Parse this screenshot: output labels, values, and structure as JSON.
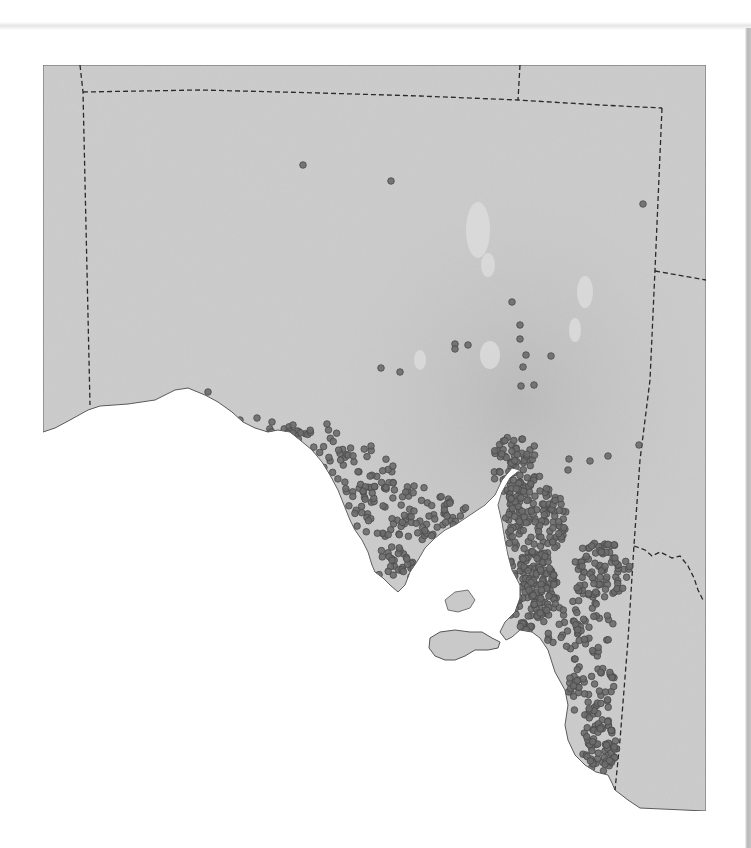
{
  "map": {
    "title": "",
    "region": "South Australia",
    "colors": {
      "land": "#c9c9c9",
      "land_dark": "#b9b9b9",
      "sea": "#ffffff",
      "coast": "#555555",
      "border": "#2a2a2a",
      "dot_fill": "#6b6b6b",
      "dot_stroke": "#4a4a4a",
      "lake": "#dcdcdc"
    },
    "frame": {
      "x": 43,
      "y": 65,
      "width": 663,
      "height": 746
    },
    "sparse_points": [
      [
        303,
        165
      ],
      [
        391,
        181
      ],
      [
        643,
        204
      ],
      [
        208,
        392
      ],
      [
        512,
        302
      ],
      [
        520,
        325
      ],
      [
        520,
        339
      ],
      [
        455,
        344
      ],
      [
        468,
        345
      ],
      [
        455,
        349
      ],
      [
        381,
        368
      ],
      [
        400,
        372
      ],
      [
        526,
        355
      ],
      [
        551,
        356
      ],
      [
        523,
        367
      ],
      [
        521,
        386
      ],
      [
        534,
        385
      ],
      [
        639,
        445
      ],
      [
        608,
        456
      ],
      [
        590,
        461
      ],
      [
        569,
        459
      ],
      [
        568,
        470
      ],
      [
        240,
        420
      ],
      [
        257,
        418
      ],
      [
        272,
        422
      ],
      [
        293,
        425
      ],
      [
        327,
        424
      ]
    ],
    "clusters": [
      {
        "name": "eyre-peninsula-west-coast",
        "cx": 300,
        "cy": 440,
        "rx": 45,
        "ry": 15,
        "count": 40
      },
      {
        "name": "eyre-peninsula-north",
        "cx": 360,
        "cy": 470,
        "rx": 40,
        "ry": 25,
        "count": 45
      },
      {
        "name": "eyre-peninsula-central",
        "cx": 400,
        "cy": 510,
        "rx": 55,
        "ry": 28,
        "count": 70
      },
      {
        "name": "eyre-peninsula-south",
        "cx": 395,
        "cy": 565,
        "rx": 20,
        "ry": 20,
        "count": 30
      },
      {
        "name": "eyre-peninsula-east",
        "cx": 440,
        "cy": 520,
        "rx": 30,
        "ry": 25,
        "count": 35
      },
      {
        "name": "spencer-gulf-head",
        "cx": 515,
        "cy": 465,
        "rx": 25,
        "ry": 30,
        "count": 70
      },
      {
        "name": "yorke-peninsula",
        "cx": 480,
        "cy": 575,
        "rx": 18,
        "ry": 40,
        "count": 70
      },
      {
        "name": "mid-north",
        "cx": 535,
        "cy": 520,
        "rx": 32,
        "ry": 45,
        "count": 160
      },
      {
        "name": "adelaide-plains",
        "cx": 530,
        "cy": 590,
        "rx": 28,
        "ry": 40,
        "count": 170
      },
      {
        "name": "riverland",
        "cx": 600,
        "cy": 570,
        "rx": 32,
        "ry": 30,
        "count": 90
      },
      {
        "name": "murraylands",
        "cx": 580,
        "cy": 630,
        "rx": 35,
        "ry": 30,
        "count": 55
      },
      {
        "name": "kangaroo-island",
        "cx": 462,
        "cy": 642,
        "rx": 32,
        "ry": 9,
        "count": 40
      },
      {
        "name": "limestone-coast-north",
        "cx": 592,
        "cy": 690,
        "rx": 25,
        "ry": 30,
        "count": 55
      },
      {
        "name": "limestone-coast-south",
        "cx": 600,
        "cy": 745,
        "rx": 18,
        "ry": 28,
        "count": 70
      }
    ],
    "dot_radius": 3.3
  }
}
